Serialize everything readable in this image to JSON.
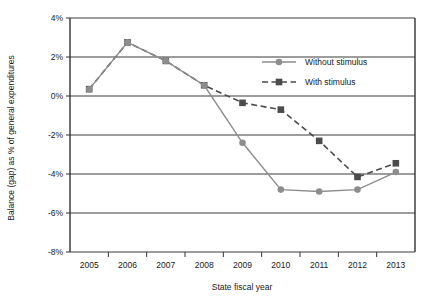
{
  "chart_data": {
    "type": "line",
    "title": "",
    "xlabel": "State fiscal year",
    "ylabel": "Balance (gap) as % of general expenditures",
    "categories": [
      "2005",
      "2006",
      "2007",
      "2008",
      "2009",
      "2010",
      "2011",
      "2012",
      "2013"
    ],
    "x": [
      2005,
      2006,
      2007,
      2008,
      2009,
      2010,
      2011,
      2012,
      2013
    ],
    "series": [
      {
        "name": "Without stimulus",
        "values": [
          0.35,
          2.75,
          1.8,
          0.55,
          -2.4,
          -4.8,
          -4.9,
          -4.8,
          -3.9
        ],
        "color": "#8d8d8d",
        "marker": "circle",
        "dash": "solid"
      },
      {
        "name": "With stimulus",
        "values": [
          0.35,
          2.75,
          1.8,
          0.55,
          -0.35,
          -0.7,
          -2.3,
          -4.15,
          -3.45
        ],
        "color": "#4b4b4b",
        "marker": "square",
        "dash": "dashed"
      }
    ],
    "ylim": [
      -8,
      4
    ],
    "ytick_values": [
      4,
      2,
      0,
      -2,
      -4,
      -6,
      -8
    ],
    "ytick_labels": [
      "4%",
      "2%",
      "0%",
      "-2%",
      "-4%",
      "-6%",
      "-8%"
    ],
    "grid": true,
    "grid_axis": "y",
    "legend_position": "inside-top-right",
    "axis_color": "#333333",
    "grid_color": "#3c3c3c",
    "background": "#ffffff"
  },
  "legend": {
    "entries": [
      {
        "label": "Without stimulus"
      },
      {
        "label": "With stimulus"
      }
    ]
  },
  "axes": {
    "x_title": "State fiscal year",
    "y_title": "Balance (gap) as % of general expenditures"
  }
}
